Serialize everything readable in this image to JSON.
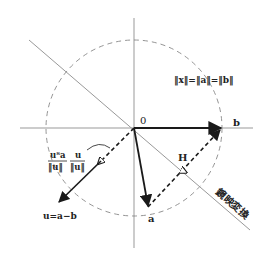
{
  "diagram": {
    "labels": {
      "origin": "0",
      "vector_b": "b",
      "vector_a": "a",
      "operator_H": "H",
      "vector_u": "u=a−b",
      "norm_equation": "‖x‖=‖a‖=‖b‖",
      "projection_num1": "uᵀa",
      "projection_den1": "‖u‖",
      "projection_num2": "u",
      "projection_den2": "‖u‖",
      "mirror_label": "鏡映変換"
    },
    "colors": {
      "axis": "#999999",
      "mirror_line": "#999999",
      "circle": "#888888",
      "vectors": "#1a1a1a",
      "background": "#ffffff"
    },
    "geometry": {
      "origin": [
        134,
        128
      ],
      "circle_radius": 88,
      "b_tip": [
        222,
        128
      ],
      "a_tip": [
        148,
        207
      ],
      "u_tip": [
        58,
        203
      ],
      "mirror_start": [
        29,
        40
      ],
      "mirror_end": [
        250,
        230
      ]
    }
  }
}
